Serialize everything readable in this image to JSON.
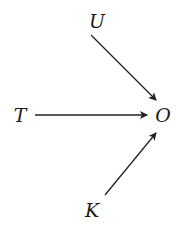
{
  "diagram": {
    "type": "causal-graph",
    "nodes": [
      {
        "id": "U",
        "label": "U",
        "x": 97,
        "y": 28
      },
      {
        "id": "T",
        "label": "T",
        "x": 20,
        "y": 122
      },
      {
        "id": "O",
        "label": "O",
        "x": 162,
        "y": 122
      },
      {
        "id": "K",
        "label": "K",
        "x": 92,
        "y": 217
      }
    ],
    "edges": [
      {
        "from": "U",
        "to": "O"
      },
      {
        "from": "T",
        "to": "O"
      },
      {
        "from": "K",
        "to": "O"
      }
    ],
    "colors": {
      "line": "#222222",
      "text": "#1a1a1a",
      "background": "#ffffff"
    }
  }
}
